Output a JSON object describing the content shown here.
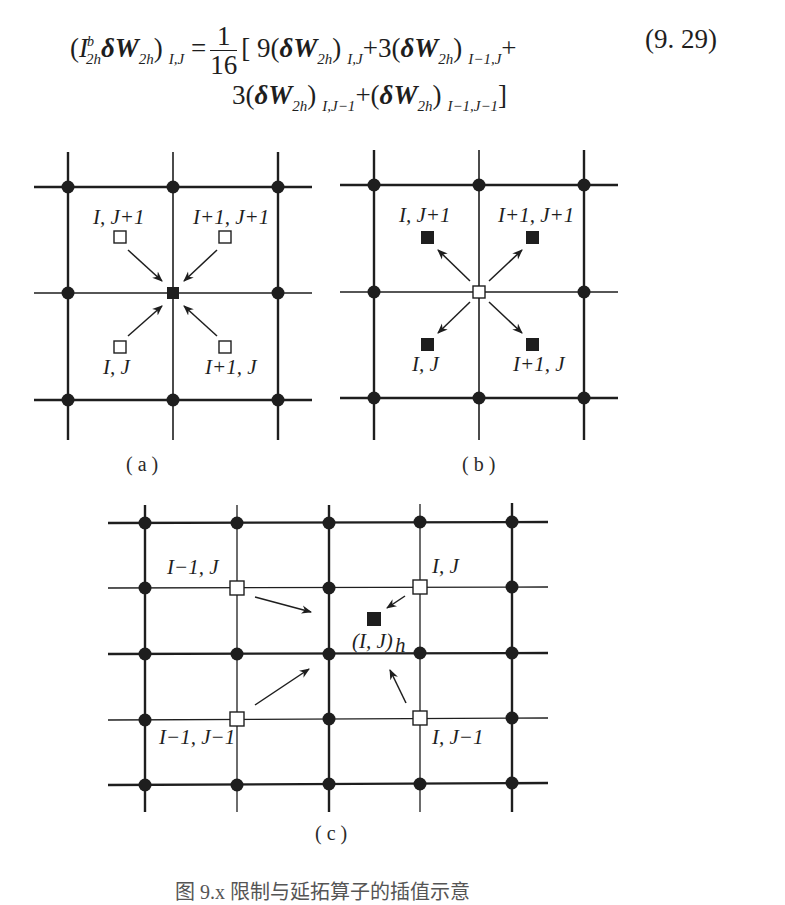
{
  "equation": {
    "number": "(9. 29)",
    "line1": {
      "lhs_open": "(",
      "operator": "I",
      "operator_sub": "2h",
      "operator_sup": "b",
      "delta_w": "δW",
      "delta_w_sub": "2h",
      "lhs_close": ")",
      "lhs_sub": "I,J",
      "equals": "=",
      "frac_num": "1",
      "frac_den": "16",
      "bracket_open": "[",
      "term1_coef": "9",
      "term1_sub": "I,J",
      "plus1": "+",
      "term2_coef": "3",
      "term2_sub": "I−1,J",
      "plus2": "+"
    },
    "line2": {
      "term3_coef": "3",
      "term3_sub": "I,J−1",
      "plus3": "+",
      "term4_sub": "I−1,J−1",
      "bracket_close": "]"
    }
  },
  "panels": {
    "a": {
      "caption": "( a )",
      "labels": [
        "I, J+1",
        "I+1, J+1",
        "I, J",
        "I+1, J"
      ],
      "description": "Four open (coarse cell-center) squares restrict into filled center square"
    },
    "b": {
      "caption": "( b )",
      "labels": [
        "I, J+1",
        "I+1, J+1",
        "I, J",
        "I+1, J"
      ],
      "description": "Open center square prolongates out to four filled squares"
    },
    "c": {
      "caption": "( c )",
      "labels": [
        "I−1, J",
        "I, J",
        "(I, J)",
        "h",
        "I−1, J−1",
        "I, J−1"
      ],
      "description": "Four coarse-grid open squares interpolate into fine-grid filled square (I,J)_h"
    }
  },
  "legend": {
    "node_marker": "filled-circle",
    "source_marker": "open-square",
    "target_marker": "filled-square"
  },
  "colors": {
    "ink": "#1e1e1e",
    "background": "#ffffff"
  },
  "caption_clipped": "图 9.x  限制与延拓算子的插值示意"
}
